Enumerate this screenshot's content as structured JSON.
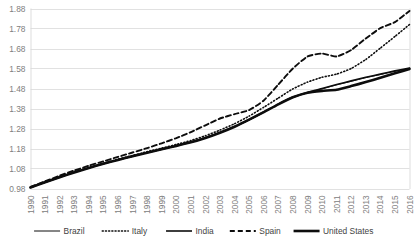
{
  "chart_data": {
    "type": "line",
    "title": "",
    "xlabel": "",
    "ylabel": "",
    "grid": "horizontal",
    "legend_position": "bottom",
    "xlim": [
      1990,
      2016
    ],
    "ylim": [
      0.98,
      1.88
    ],
    "x": [
      1990,
      1991,
      1992,
      1993,
      1994,
      1995,
      1996,
      1997,
      1998,
      1999,
      2000,
      2001,
      2002,
      2003,
      2004,
      2005,
      2006,
      2007,
      2008,
      2009,
      2010,
      2011,
      2012,
      2013,
      2014,
      2015,
      2016
    ],
    "xtick_labels": [
      "1990",
      "1991",
      "1992",
      "1993",
      "1994",
      "1995",
      "1996",
      "1997",
      "1998",
      "1999",
      "2000",
      "2001",
      "2002",
      "2003",
      "2004",
      "2005",
      "2006",
      "2007",
      "2008",
      "2009",
      "2010",
      "2011",
      "2012",
      "2013",
      "2014",
      "2015",
      "2016"
    ],
    "ytick_labels": [
      "1.88",
      "1.78",
      "1.68",
      "1.58",
      "1.48",
      "1.38",
      "1.28",
      "1.18",
      "1.08",
      "0.98"
    ],
    "ytick_values": [
      1.88,
      1.78,
      1.68,
      1.58,
      1.48,
      1.38,
      1.28,
      1.18,
      1.08,
      0.98
    ],
    "series": [
      {
        "name": "Brazil",
        "style": "solid-thin",
        "stroke_width": 1.0,
        "dash": "none",
        "color": "#0d0d0d",
        "values": [
          0.985,
          1.01,
          1.035,
          1.06,
          1.082,
          1.103,
          1.122,
          1.14,
          1.158,
          1.175,
          1.192,
          1.21,
          1.232,
          1.258,
          1.288,
          1.322,
          1.36,
          1.4,
          1.435,
          1.458,
          1.478,
          1.498,
          1.516,
          1.534,
          1.55,
          1.566,
          1.58
        ]
      },
      {
        "name": "Italy",
        "style": "dotted",
        "stroke_width": 1.6,
        "dash": "1,2.2",
        "color": "#0d0d0d",
        "values": [
          0.985,
          1.012,
          1.038,
          1.062,
          1.085,
          1.106,
          1.126,
          1.145,
          1.164,
          1.182,
          1.2,
          1.22,
          1.244,
          1.272,
          1.304,
          1.342,
          1.386,
          1.432,
          1.478,
          1.512,
          1.536,
          1.552,
          1.58,
          1.625,
          1.682,
          1.74,
          1.8
        ]
      },
      {
        "name": "India",
        "style": "solid-medium",
        "stroke_width": 1.6,
        "dash": "none",
        "color": "#0d0d0d",
        "values": [
          0.985,
          1.011,
          1.036,
          1.061,
          1.083,
          1.104,
          1.124,
          1.142,
          1.16,
          1.177,
          1.194,
          1.212,
          1.234,
          1.26,
          1.29,
          1.325,
          1.363,
          1.402,
          1.437,
          1.46,
          1.48,
          1.5,
          1.518,
          1.536,
          1.552,
          1.568,
          1.582
        ]
      },
      {
        "name": "Spain",
        "style": "dashed",
        "stroke_width": 1.9,
        "dash": "5,3",
        "color": "#0d0d0d",
        "values": [
          0.988,
          1.016,
          1.044,
          1.07,
          1.094,
          1.116,
          1.138,
          1.16,
          1.182,
          1.206,
          1.232,
          1.262,
          1.296,
          1.33,
          1.352,
          1.372,
          1.42,
          1.5,
          1.58,
          1.64,
          1.655,
          1.64,
          1.672,
          1.73,
          1.782,
          1.812,
          1.868
        ]
      },
      {
        "name": "United States",
        "style": "solid-thick",
        "stroke_width": 2.6,
        "dash": "none",
        "color": "#0d0d0d",
        "values": [
          0.985,
          1.011,
          1.036,
          1.06,
          1.083,
          1.104,
          1.123,
          1.141,
          1.159,
          1.176,
          1.193,
          1.211,
          1.233,
          1.259,
          1.289,
          1.324,
          1.362,
          1.401,
          1.436,
          1.459,
          1.468,
          1.474,
          1.492,
          1.512,
          1.534,
          1.556,
          1.578
        ]
      }
    ]
  },
  "legend": {
    "items": [
      {
        "label": "Brazil"
      },
      {
        "label": "Italy"
      },
      {
        "label": "India"
      },
      {
        "label": "Spain"
      },
      {
        "label": "United States"
      }
    ]
  }
}
